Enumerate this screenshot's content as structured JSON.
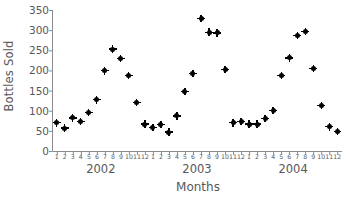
{
  "chart_data": {
    "type": "scatter",
    "title": "",
    "xlabel": "Months",
    "ylabel": "Bottles Sold",
    "ylim": [
      0,
      350
    ],
    "y_ticks": [
      0,
      50,
      100,
      150,
      200,
      250,
      300,
      350
    ],
    "grid": false,
    "legend": "none",
    "x_tick_labels": [
      "1",
      "2",
      "3",
      "4",
      "5",
      "6",
      "7",
      "8",
      "9",
      "10",
      "11",
      "12",
      "1",
      "2",
      "3",
      "4",
      "5",
      "6",
      "7",
      "8",
      "9",
      "10",
      "11",
      "12",
      "1",
      "2",
      "3",
      "4",
      "5",
      "6",
      "7",
      "8",
      "9",
      "10",
      "11",
      "12"
    ],
    "group_labels": [
      {
        "label": "2002",
        "center_index": 5.5
      },
      {
        "label": "2003",
        "center_index": 17.5
      },
      {
        "label": "2004",
        "center_index": 29.5
      }
    ],
    "series": [
      {
        "name": "Bottles Sold",
        "color": "#000000",
        "marker": "diamond",
        "points": [
          {
            "year": 2002,
            "month": 1,
            "value": 70
          },
          {
            "year": 2002,
            "month": 2,
            "value": 57
          },
          {
            "year": 2002,
            "month": 3,
            "value": 82
          },
          {
            "year": 2002,
            "month": 4,
            "value": 73
          },
          {
            "year": 2002,
            "month": 5,
            "value": 95
          },
          {
            "year": 2002,
            "month": 6,
            "value": 127
          },
          {
            "year": 2002,
            "month": 7,
            "value": 199
          },
          {
            "year": 2002,
            "month": 8,
            "value": 253
          },
          {
            "year": 2002,
            "month": 9,
            "value": 229
          },
          {
            "year": 2002,
            "month": 10,
            "value": 187
          },
          {
            "year": 2002,
            "month": 11,
            "value": 120
          },
          {
            "year": 2002,
            "month": 12,
            "value": 67
          },
          {
            "year": 2003,
            "month": 1,
            "value": 58
          },
          {
            "year": 2003,
            "month": 2,
            "value": 66
          },
          {
            "year": 2003,
            "month": 3,
            "value": 47
          },
          {
            "year": 2003,
            "month": 4,
            "value": 87
          },
          {
            "year": 2003,
            "month": 5,
            "value": 147
          },
          {
            "year": 2003,
            "month": 6,
            "value": 193
          },
          {
            "year": 2003,
            "month": 7,
            "value": 329
          },
          {
            "year": 2003,
            "month": 8,
            "value": 295
          },
          {
            "year": 2003,
            "month": 9,
            "value": 293
          },
          {
            "year": 2003,
            "month": 10,
            "value": 203
          },
          {
            "year": 2003,
            "month": 11,
            "value": 70
          },
          {
            "year": 2003,
            "month": 12,
            "value": 74
          },
          {
            "year": 2004,
            "month": 1,
            "value": 67
          },
          {
            "year": 2004,
            "month": 2,
            "value": 67
          },
          {
            "year": 2004,
            "month": 3,
            "value": 81
          },
          {
            "year": 2004,
            "month": 4,
            "value": 101
          },
          {
            "year": 2004,
            "month": 5,
            "value": 187
          },
          {
            "year": 2004,
            "month": 6,
            "value": 231
          },
          {
            "year": 2004,
            "month": 7,
            "value": 287
          },
          {
            "year": 2004,
            "month": 8,
            "value": 297
          },
          {
            "year": 2004,
            "month": 9,
            "value": 205
          },
          {
            "year": 2004,
            "month": 10,
            "value": 113
          },
          {
            "year": 2004,
            "month": 11,
            "value": 60
          },
          {
            "year": 2004,
            "month": 12,
            "value": 49
          }
        ]
      }
    ]
  },
  "axes": {
    "line_color": "#8c8c8e",
    "text_color": "#58585a"
  }
}
